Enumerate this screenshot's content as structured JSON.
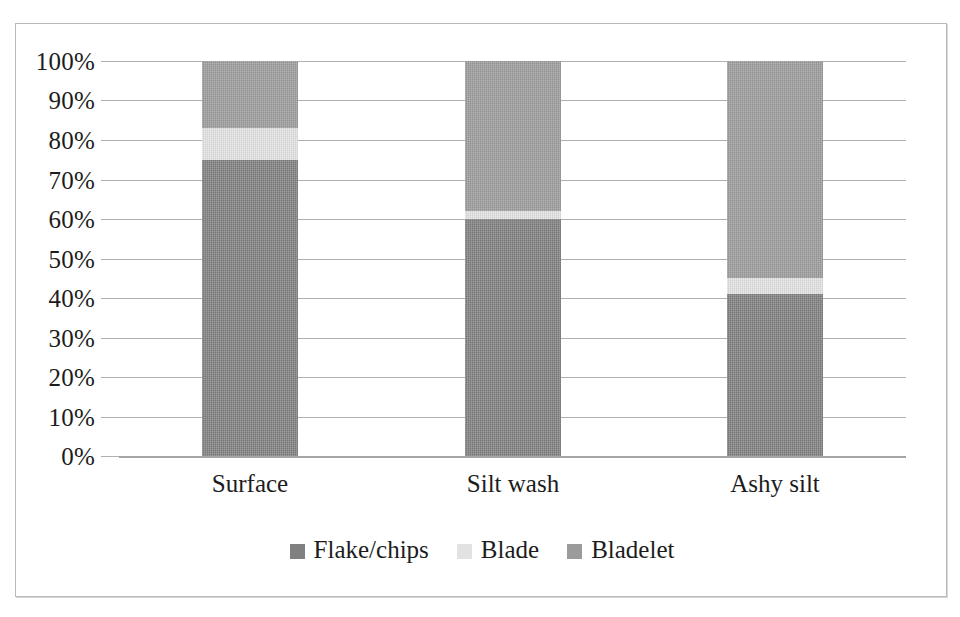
{
  "chart_data": {
    "type": "bar",
    "subtype": "stacked-100-percent",
    "title": "",
    "xlabel": "",
    "ylabel": "",
    "categories": [
      "Surface",
      "Silt wash",
      "Ashy silt"
    ],
    "series": [
      {
        "name": "Flake/chips",
        "color": "#808080",
        "values": [
          75,
          60,
          41
        ]
      },
      {
        "name": "Blade",
        "color": "#e2e2e2",
        "values": [
          8,
          2,
          4
        ]
      },
      {
        "name": "Bladelet",
        "color": "#9b9b9b",
        "values": [
          17,
          38,
          55
        ]
      }
    ],
    "ylim": [
      0,
      100
    ],
    "ytick_labels": [
      "100%",
      "90%",
      "80%",
      "70%",
      "60%",
      "50%",
      "40%",
      "30%",
      "20%",
      "10%",
      "0%"
    ],
    "ytick_values": [
      100,
      90,
      80,
      70,
      60,
      50,
      40,
      30,
      20,
      10,
      0
    ],
    "grid": true,
    "legend_position": "bottom",
    "legend_entries": [
      "Flake/chips",
      "Blade",
      "Bladelet"
    ]
  },
  "colors": {
    "flake_chips": "#808080",
    "blade": "#e2e2e2",
    "bladelet": "#9b9b9b",
    "gridline": "#b0b0b0",
    "frame_border": "#b9b9b9",
    "text": "#1c1c1c"
  }
}
